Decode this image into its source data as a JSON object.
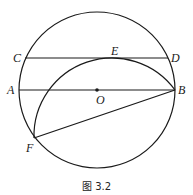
{
  "figure": {
    "caption": "图 3.2",
    "points": {
      "A": {
        "label": "A",
        "x": 18,
        "y": 90
      },
      "B": {
        "label": "B",
        "x": 175,
        "y": 90
      },
      "C": {
        "label": "C",
        "x": 25,
        "y": 58
      },
      "D": {
        "label": "D",
        "x": 168,
        "y": 58
      },
      "E": {
        "label": "E",
        "x": 112,
        "y": 58
      },
      "F": {
        "label": "F",
        "x": 34,
        "y": 138
      },
      "O": {
        "label": "O",
        "x": 97,
        "y": 90
      }
    },
    "circle": {
      "cx": 97,
      "cy": 90,
      "r": 78
    },
    "fold_arc": {
      "cx": 112,
      "cy": 136,
      "r": 78
    },
    "stroke_color": "#1a1a1a"
  }
}
